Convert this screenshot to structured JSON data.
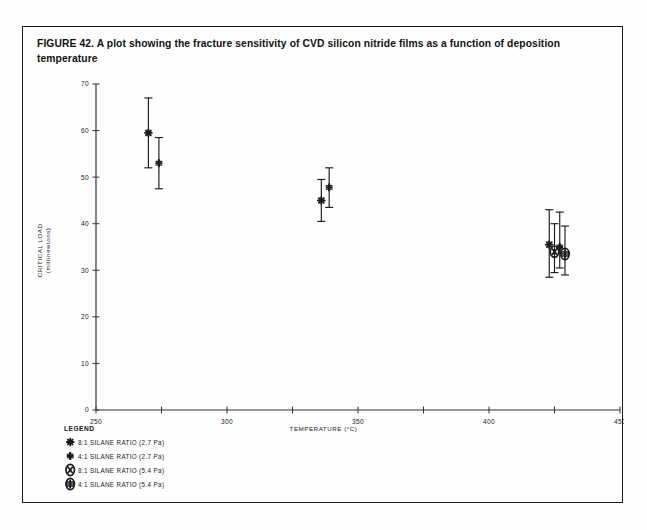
{
  "figure": {
    "caption": "FIGURE 42. A plot showing the fracture sensitivity of CVD silicon nitride films as a function of deposition temperature"
  },
  "legend": {
    "title": "LEGEND",
    "items": [
      {
        "marker": "asterisk-marker-icon",
        "label": "8:1 SILANE RATIO (2.7 Pa)"
      },
      {
        "marker": "plus-marker-icon",
        "label": "4:1 SILANE RATIO (2.7 Pa)"
      },
      {
        "marker": "circled-x-marker-icon",
        "label": "8:1 SILANE RATIO (5.4 Pa)"
      },
      {
        "marker": "circled-plus-marker-icon",
        "label": "4:1 SILANE RATIO (5.4 Pa)"
      }
    ]
  },
  "chart_data": {
    "type": "scatter",
    "title": "",
    "xlabel": "TEMPERATURE (°C)",
    "ylabel_line1": "CRITICAL LOAD",
    "ylabel_line2": "(millinewtons)",
    "xlim": [
      250,
      450
    ],
    "ylim": [
      0,
      70
    ],
    "xticks": [
      250,
      275,
      300,
      325,
      350,
      375,
      400,
      425,
      450
    ],
    "xtick_labels": [
      "250",
      "",
      "300",
      "",
      "350",
      "",
      "400",
      "",
      "450"
    ],
    "yticks": [
      0,
      10,
      20,
      30,
      40,
      50,
      60,
      70
    ],
    "ytick_labels": [
      "0",
      "10",
      "20",
      "30",
      "40",
      "50",
      "60",
      "70"
    ],
    "grid": false,
    "legend_position": "below-axes-left",
    "series": [
      {
        "name": "8:1 SILANE RATIO (2.7 Pa)",
        "marker": "asterisk",
        "points": [
          {
            "x": 270,
            "y": 59.5,
            "yerr_low": 52.0,
            "yerr_high": 67.0
          },
          {
            "x": 336,
            "y": 45.0,
            "yerr_low": 40.5,
            "yerr_high": 49.5
          },
          {
            "x": 423,
            "y": 35.5,
            "yerr_low": 28.5,
            "yerr_high": 43.0
          }
        ]
      },
      {
        "name": "4:1 SILANE RATIO (2.7 Pa)",
        "marker": "plus",
        "points": [
          {
            "x": 274,
            "y": 53.0,
            "yerr_low": 47.5,
            "yerr_high": 58.5
          },
          {
            "x": 339,
            "y": 47.8,
            "yerr_low": 43.5,
            "yerr_high": 52.0
          },
          {
            "x": 427,
            "y": 35.0,
            "yerr_low": 30.5,
            "yerr_high": 42.5
          }
        ]
      },
      {
        "name": "8:1 SILANE RATIO (5.4 Pa)",
        "marker": "circled-x",
        "points": [
          {
            "x": 425,
            "y": 34.0,
            "yerr_low": 29.5,
            "yerr_high": 40.0
          }
        ]
      },
      {
        "name": "4:1 SILANE RATIO (5.4 Pa)",
        "marker": "circled-plus",
        "points": [
          {
            "x": 429,
            "y": 33.5,
            "yerr_low": 29.0,
            "yerr_high": 39.5
          }
        ]
      }
    ]
  },
  "colors": {
    "ink": "#1a1a1a",
    "axis": "#333333",
    "page": "#fefefd",
    "border": "#1a1a1a"
  }
}
